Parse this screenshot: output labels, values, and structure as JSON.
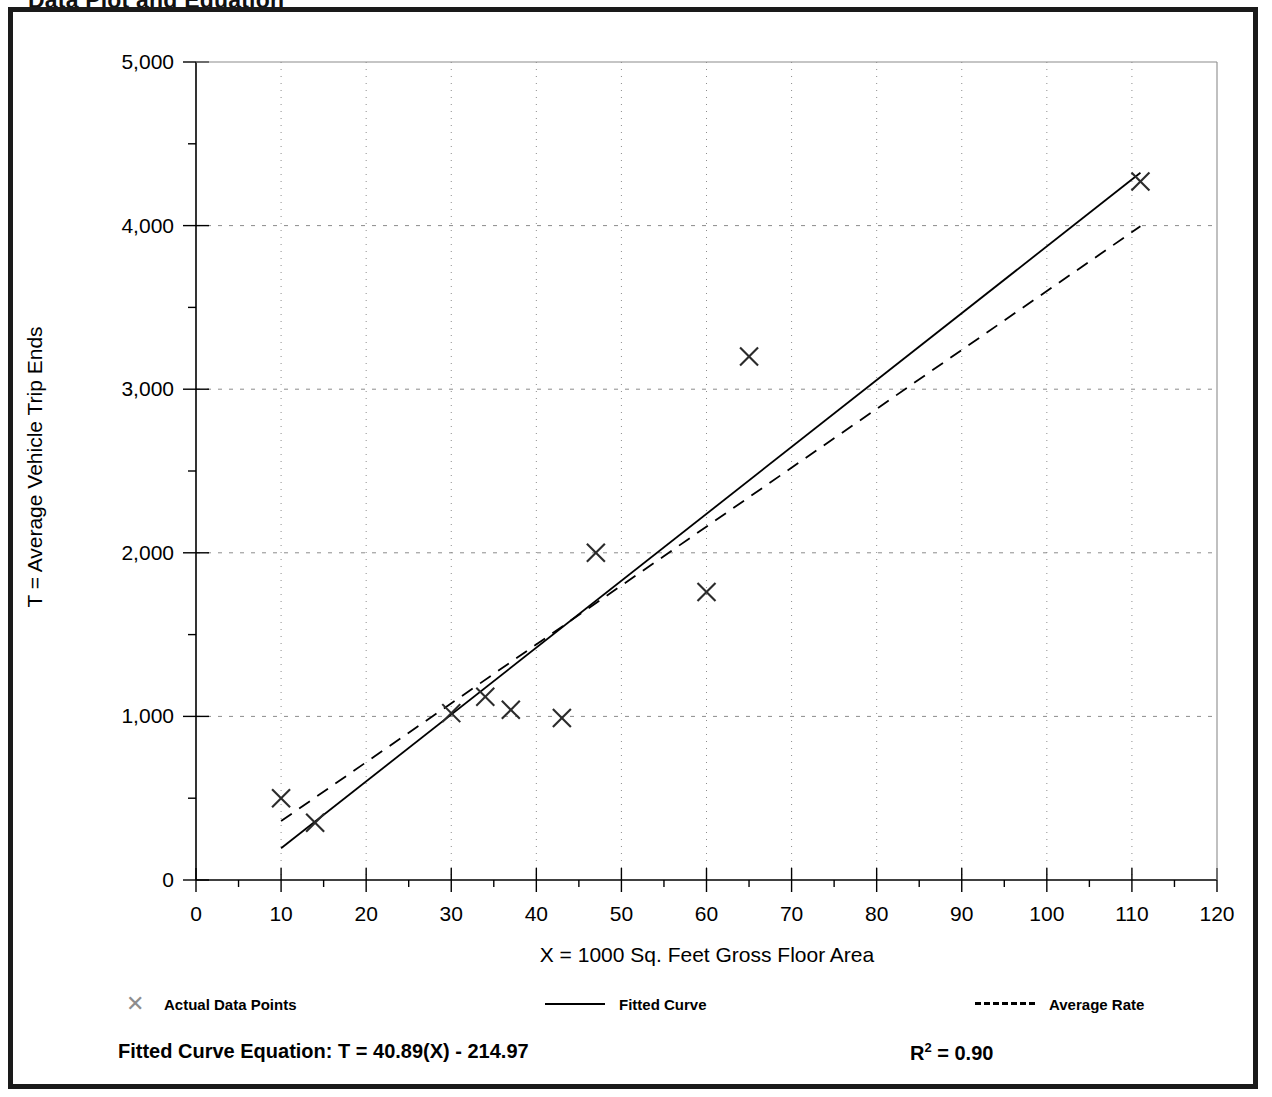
{
  "page_title": "Data Plot and Equation",
  "axes": {
    "y_title": "T = Average Vehicle Trip Ends",
    "x_title": "X = 1000 Sq. Feet Gross Floor Area",
    "y_ticks": [
      "0",
      "1,000",
      "2,000",
      "3,000",
      "4,000",
      "5,000"
    ],
    "x_ticks": [
      "0",
      "10",
      "20",
      "30",
      "40",
      "50",
      "60",
      "70",
      "80",
      "90",
      "100",
      "110",
      "120"
    ]
  },
  "legend": {
    "items": [
      {
        "label": "Actual Data Points",
        "marker": "x-marker-icon"
      },
      {
        "label": "Fitted Curve",
        "marker": "solid-line-icon"
      },
      {
        "label": "Average Rate",
        "marker": "dashed-line-icon"
      }
    ]
  },
  "equation": {
    "text": "Fitted Curve Equation:  T = 40.89(X) - 214.97",
    "r_squared_label": "R",
    "r_squared_exponent": "2",
    "r_squared_value": " = 0.90"
  },
  "colors": {
    "ink": "#000000",
    "frame": "#1a1a1a",
    "grid": "#8c8c8c",
    "marker": "#2b2b2b",
    "fitted_curve": "#000000",
    "average_rate": "#000000"
  },
  "chart_data": {
    "type": "scatter",
    "title": "Data Plot and Equation",
    "xlabel": "X = 1000 Sq. Feet Gross Floor Area",
    "ylabel": "T = Average Vehicle Trip Ends",
    "xlim": [
      0,
      120
    ],
    "ylim": [
      0,
      5000
    ],
    "xticks": [
      0,
      10,
      20,
      30,
      40,
      50,
      60,
      70,
      80,
      90,
      100,
      110,
      120
    ],
    "yticks": [
      0,
      1000,
      2000,
      3000,
      4000,
      5000
    ],
    "x_minor_tick_step": 5,
    "y_minor_tick_step": 500,
    "grid": true,
    "grid_style": "dotted",
    "legend_position": "below-plot",
    "series": [
      {
        "name": "Actual Data Points",
        "type": "scatter",
        "marker": "x",
        "points": [
          {
            "x": 10,
            "y": 500
          },
          {
            "x": 14,
            "y": 350
          },
          {
            "x": 30,
            "y": 1020
          },
          {
            "x": 34,
            "y": 1120
          },
          {
            "x": 37,
            "y": 1040
          },
          {
            "x": 43,
            "y": 990
          },
          {
            "x": 47,
            "y": 2000
          },
          {
            "x": 60,
            "y": 1760
          },
          {
            "x": 65,
            "y": 3200
          },
          {
            "x": 111,
            "y": 4270
          }
        ]
      },
      {
        "name": "Fitted Curve",
        "type": "line",
        "style": "solid",
        "equation": "T = 40.89(X) - 214.97",
        "r_squared": 0.9,
        "slope": 40.89,
        "intercept": -214.97,
        "endpoints": [
          {
            "x": 10,
            "y": 194
          },
          {
            "x": 111,
            "y": 4323
          }
        ]
      },
      {
        "name": "Average Rate",
        "type": "line",
        "style": "dashed",
        "slope": 36.0,
        "intercept": 0,
        "endpoints": [
          {
            "x": 10,
            "y": 360
          },
          {
            "x": 111,
            "y": 3996
          }
        ]
      }
    ]
  }
}
